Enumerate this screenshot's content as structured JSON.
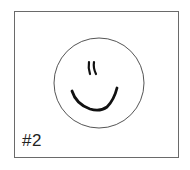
{
  "figure": {
    "label": "#2",
    "colors": {
      "border": "#6a6a6a",
      "stroke": "#111111",
      "circle": "#555555",
      "background": "#ffffff"
    }
  }
}
